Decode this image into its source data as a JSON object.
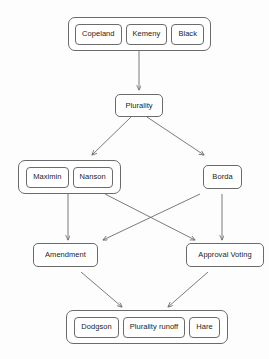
{
  "diagram": {
    "type": "flowchart",
    "background_color": "#fdfdfd",
    "stroke_color": "#6b6b6b",
    "arrow_color": "#6b6b6b",
    "text_color": "#1b1b1b",
    "levels": [
      {
        "id": "level-1",
        "kind": "group",
        "nodes": [
          {
            "id": "copeland",
            "label": "Copeland"
          },
          {
            "id": "kemeny",
            "label": "Kemeny"
          },
          {
            "id": "black",
            "label": "Black"
          }
        ]
      },
      {
        "id": "level-2",
        "kind": "single",
        "nodes": [
          {
            "id": "plurality",
            "label": "Plurality"
          }
        ]
      },
      {
        "id": "level-3",
        "kind": "mixed",
        "nodes": [
          {
            "id": "maximin",
            "label": "Maximin"
          },
          {
            "id": "nanson",
            "label": "Nanson"
          },
          {
            "id": "borda",
            "label": "Borda"
          }
        ]
      },
      {
        "id": "level-4",
        "kind": "pair",
        "nodes": [
          {
            "id": "amendment",
            "label": "Amendment"
          },
          {
            "id": "approval-voting",
            "label": "Approval Voting"
          }
        ]
      },
      {
        "id": "level-5",
        "kind": "group",
        "nodes": [
          {
            "id": "dodgson",
            "label": "Dodgson"
          },
          {
            "id": "plurality-runoff",
            "label": "Plurality runoff"
          },
          {
            "id": "hare",
            "label": "Hare"
          }
        ]
      }
    ],
    "edges": [
      {
        "id": "edge-top-to-plurality",
        "from": "level-1",
        "to": "plurality"
      },
      {
        "id": "edge-plurality-to-maximin-nanson",
        "from": "plurality",
        "to": "maximin-nanson-group"
      },
      {
        "id": "edge-plurality-to-borda",
        "from": "plurality",
        "to": "borda"
      },
      {
        "id": "edge-maximin-nanson-to-amendment",
        "from": "maximin-nanson-group",
        "to": "amendment"
      },
      {
        "id": "edge-maximin-nanson-to-approval-voting",
        "from": "maximin-nanson-group",
        "to": "approval-voting"
      },
      {
        "id": "edge-borda-to-approval-voting",
        "from": "borda",
        "to": "approval-voting"
      },
      {
        "id": "edge-borda-to-amendment",
        "from": "borda",
        "to": "amendment"
      },
      {
        "id": "edge-amendment-to-bottom",
        "from": "amendment",
        "to": "level-5"
      },
      {
        "id": "edge-approval-voting-to-bottom",
        "from": "approval-voting",
        "to": "level-5"
      }
    ]
  }
}
